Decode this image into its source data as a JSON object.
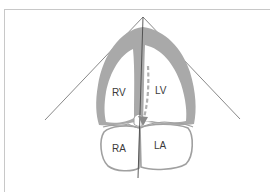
{
  "figure": {
    "chambers": [
      {
        "id": "rv",
        "label": "RV"
      },
      {
        "id": "lv",
        "label": "LV"
      },
      {
        "id": "ra",
        "label": "RA"
      },
      {
        "id": "la",
        "label": "LA"
      }
    ],
    "colors": {
      "myocardium": "#a9a9a9",
      "outline": "#a0a0a0",
      "sector_line": "#6a6a6a",
      "scan_line": "#4a4a4a",
      "arrow": "#9a9a9a",
      "text": "#3a3a3a",
      "frame": "#c8c8c8"
    }
  }
}
